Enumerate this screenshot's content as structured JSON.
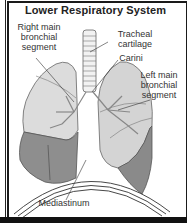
{
  "title": "Lower Respiratory System",
  "labels": {
    "right_main_bronchial_segment": [
      "Right main",
      "bronchial",
      "segment"
    ],
    "tracheal_cartilage": [
      "Tracheal",
      "cartilage"
    ],
    "carini": "Carini",
    "left_main_bronchial_segment": [
      "Left main",
      "bronchial",
      "segment"
    ],
    "mediastinum": "Mediastinum"
  },
  "colors": {
    "frame": "#1a1a1a",
    "lung_upper": "#d9d9d9",
    "lung_lower": "#8c8c8c",
    "outline": "#555555"
  }
}
